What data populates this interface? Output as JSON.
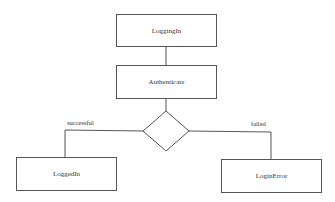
{
  "diagram": {
    "states": [
      {
        "id": "logging-in",
        "label": "LoggingIn"
      },
      {
        "id": "authenticate",
        "label": "Authenticate"
      },
      {
        "id": "logged-in",
        "label": "LoggedIn"
      },
      {
        "id": "login-error",
        "label": "LoginError"
      }
    ],
    "decision": {
      "shape": "diamond"
    },
    "transitions": [
      {
        "from": "LoggingIn",
        "to": "Authenticate",
        "label": ""
      },
      {
        "from": "Authenticate",
        "to": "decision",
        "label": ""
      },
      {
        "from": "decision",
        "to": "LoggedIn",
        "label": "successful"
      },
      {
        "from": "decision",
        "to": "LoginError",
        "label": "failed"
      }
    ],
    "colors": {
      "line": "#555555",
      "background": "#ffffff"
    }
  }
}
